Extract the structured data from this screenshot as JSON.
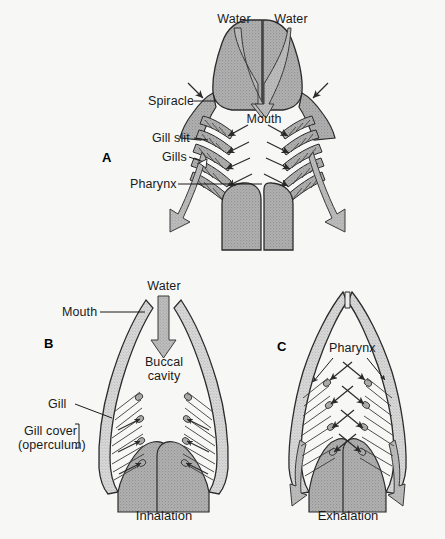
{
  "figure": {
    "background_color": "#f7f7f6",
    "ink_color": "#1a1a1a",
    "tissue_fill": "#a9a9a9",
    "wall_fill": "#cfcfcf",
    "arrow_fill": "#b5b5b5"
  },
  "panels": [
    {
      "letter": "A",
      "caption": "",
      "labels": {
        "water_left": "Water",
        "water_right": "Water",
        "mouth": "Mouth",
        "spiracle": "Spiracle",
        "gill_slit": "Gill slit",
        "gills": "Gills",
        "pharynx": "Pharynx"
      }
    },
    {
      "letter": "B",
      "caption": "Inhalation",
      "labels": {
        "water": "Water",
        "mouth": "Mouth",
        "buccal_cavity_line1": "Buccal",
        "buccal_cavity_line2": "cavity",
        "gill": "Gill",
        "gill_cover_line1": "Gill cover",
        "gill_cover_line2": "(operculum)"
      }
    },
    {
      "letter": "C",
      "caption": "Exhalation",
      "labels": {
        "pharynx": "Pharynx"
      }
    }
  ]
}
